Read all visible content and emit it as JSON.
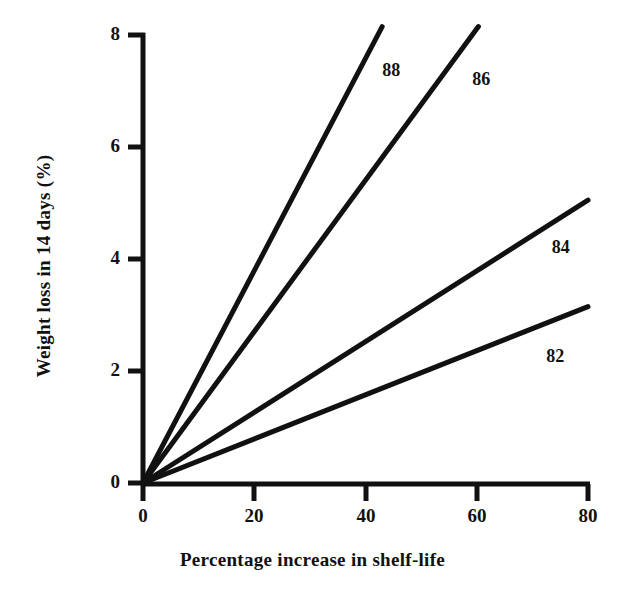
{
  "chart_data": {
    "type": "line",
    "title": "",
    "xlabel": "Percentage increase in shelf-life",
    "ylabel": "Weight loss in 14 days (%)",
    "xlim": [
      0,
      80
    ],
    "ylim": [
      0,
      8.2
    ],
    "xticks": [
      0,
      20,
      40,
      60,
      80
    ],
    "xtick_labels": [
      "0",
      "20",
      "40",
      "60",
      "80"
    ],
    "yticks": [
      0,
      2,
      4,
      6,
      8
    ],
    "ytick_labels": [
      "0",
      "2",
      "4",
      "6",
      "8"
    ],
    "grid": false,
    "legend": "inline-end-labels",
    "line_color": "#111111",
    "background": "#ffffff",
    "series": [
      {
        "name": "88",
        "label": "88",
        "x": [
          0,
          43
        ],
        "y": [
          0,
          8.15
        ],
        "slope": 0.1895,
        "label_pos": {
          "x": 43,
          "y": 7.35
        }
      },
      {
        "name": "86",
        "label": "86",
        "x": [
          0,
          60.3
        ],
        "y": [
          0,
          8.15
        ],
        "slope": 0.1352,
        "label_pos": {
          "x": 59.2,
          "y": 7.2
        }
      },
      {
        "name": "84",
        "label": "84",
        "x": [
          0,
          80
        ],
        "y": [
          0,
          5.05
        ],
        "slope": 0.0631,
        "label_pos": {
          "x": 73.5,
          "y": 4.2
        }
      },
      {
        "name": "82",
        "label": "82",
        "x": [
          0,
          80
        ],
        "y": [
          0,
          3.15
        ],
        "slope": 0.0394,
        "label_pos": {
          "x": 72.5,
          "y": 2.25
        }
      }
    ]
  },
  "axis_titles": {
    "x": "Percentage increase in shelf-life",
    "y": "Weight loss in 14 days (%)"
  }
}
